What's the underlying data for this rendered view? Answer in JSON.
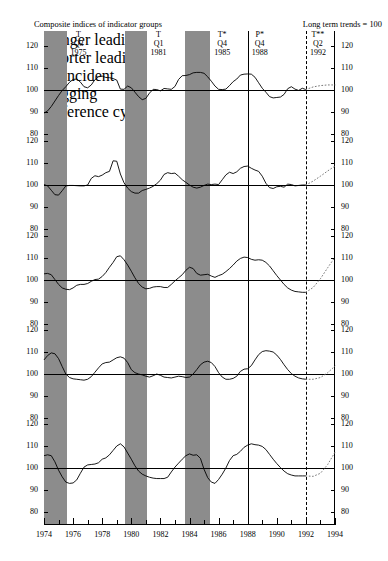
{
  "title": {
    "left": "Composite indices of indicator groups",
    "right": "Long term trends = 100"
  },
  "chart_data": {
    "type": "line",
    "title": "Composite indices of indicator groups",
    "subtitle": "Long term trends = 100",
    "xlabel": "",
    "ylabel": "",
    "xlim": [
      1974,
      1994
    ],
    "ylim": [
      80,
      120
    ],
    "yticks": [
      80,
      90,
      100,
      110,
      120
    ],
    "xticks": [
      1974,
      1975,
      1976,
      1977,
      1978,
      1979,
      1980,
      1981,
      1982,
      1983,
      1984,
      1985,
      1986,
      1987,
      1988,
      1989,
      1990,
      1991,
      1992,
      1993,
      1994
    ],
    "xticklabels": [
      "1974",
      "1976",
      "1978",
      "1980",
      "1982",
      "1984",
      "1986",
      "1988",
      "1990",
      "1992",
      "1994"
    ],
    "grid": false,
    "reference_line": 100,
    "legend_position": "inline-panel-label",
    "panels": [
      {
        "name": "Longer leading",
        "label": "Longer leading",
        "x": [
          1974.0,
          1974.25,
          1974.5,
          1974.75,
          1975.0,
          1975.25,
          1975.5,
          1975.75,
          1976.0,
          1976.25,
          1976.5,
          1976.75,
          1977.0,
          1977.25,
          1977.5,
          1977.75,
          1978.0,
          1978.25,
          1978.5,
          1978.75,
          1979.0,
          1979.25,
          1979.5,
          1979.75,
          1980.0,
          1980.25,
          1980.5,
          1980.75,
          1981.0,
          1981.25,
          1981.5,
          1981.75,
          1982.0,
          1982.25,
          1982.5,
          1982.75,
          1983.0,
          1983.25,
          1983.5,
          1983.75,
          1984.0,
          1984.25,
          1984.5,
          1984.75,
          1985.0,
          1985.25,
          1985.5,
          1985.75,
          1986.0,
          1986.25,
          1986.5,
          1986.75,
          1987.0,
          1987.25,
          1987.5,
          1987.75,
          1988.0,
          1988.25,
          1988.5,
          1988.75,
          1989.0,
          1989.25,
          1989.5,
          1989.75,
          1990.0,
          1990.25,
          1990.5,
          1990.75,
          1991.0,
          1991.25,
          1991.5,
          1991.75,
          1992.0
        ],
        "values": [
          89.5,
          90.5,
          92.5,
          95.0,
          97.5,
          99.8,
          101.5,
          103.5,
          104.8,
          105.0,
          103.6,
          101.5,
          101.0,
          102.3,
          104.7,
          106.0,
          106.3,
          105.7,
          105.6,
          105.2,
          104.5,
          100.4,
          100.3,
          101.8,
          101.0,
          99.0,
          97.0,
          95.6,
          96.2,
          98.6,
          100.3,
          100.2,
          99.6,
          100.7,
          100.5,
          100.3,
          101.6,
          104.8,
          106.5,
          106.6,
          107.0,
          107.8,
          108.0,
          108.0,
          107.6,
          106.0,
          104.0,
          101.8,
          100.3,
          100.2,
          100.4,
          102.0,
          103.8,
          105.0,
          106.8,
          107.2,
          107.3,
          107.2,
          105.8,
          103.3,
          100.8,
          99.0,
          97.0,
          96.4,
          96.6,
          96.8,
          98.0,
          100.6,
          101.5,
          100.4,
          99.8,
          100.8,
          100.2
        ],
        "forecast_x": [
          1992.0,
          1992.5,
          1993.0,
          1993.5,
          1994.0
        ],
        "forecast_values": [
          100.2,
          101.4,
          102.0,
          102.3,
          102.3
        ]
      },
      {
        "name": "Shorter leading",
        "label": "Shorter leading",
        "x": [
          1974.0,
          1974.25,
          1974.5,
          1974.75,
          1975.0,
          1975.25,
          1975.5,
          1975.75,
          1976.0,
          1976.25,
          1976.5,
          1976.75,
          1977.0,
          1977.25,
          1977.5,
          1977.75,
          1978.0,
          1978.25,
          1978.5,
          1978.75,
          1979.0,
          1979.25,
          1979.5,
          1979.75,
          1980.0,
          1980.25,
          1980.5,
          1980.75,
          1981.0,
          1981.25,
          1981.5,
          1981.75,
          1982.0,
          1982.25,
          1982.5,
          1982.75,
          1983.0,
          1983.25,
          1983.5,
          1983.75,
          1984.0,
          1984.25,
          1984.5,
          1984.75,
          1985.0,
          1985.25,
          1985.5,
          1985.75,
          1986.0,
          1986.25,
          1986.5,
          1986.75,
          1987.0,
          1987.25,
          1987.5,
          1987.75,
          1988.0,
          1988.25,
          1988.5,
          1988.75,
          1989.0,
          1989.25,
          1989.5,
          1989.75,
          1990.0,
          1990.25,
          1990.5,
          1990.75,
          1991.0,
          1991.25,
          1991.5,
          1991.75,
          1992.0
        ],
        "values": [
          100.2,
          99.6,
          97.6,
          95.6,
          95.4,
          97.4,
          99.6,
          99.8,
          99.8,
          99.7,
          99.6,
          99.6,
          100.0,
          103.0,
          104.2,
          103.8,
          104.5,
          105.6,
          106.2,
          111.0,
          110.8,
          105.0,
          101.0,
          98.6,
          97.0,
          96.3,
          96.3,
          97.5,
          98.0,
          98.6,
          99.4,
          100.6,
          102.2,
          104.8,
          105.6,
          105.2,
          105.4,
          104.0,
          102.4,
          101.2,
          100.0,
          99.0,
          98.6,
          99.0,
          99.8,
          100.4,
          100.2,
          100.4,
          100.2,
          102.4,
          104.6,
          105.8,
          105.2,
          106.0,
          107.6,
          108.4,
          108.6,
          107.6,
          106.8,
          106.2,
          104.0,
          100.8,
          98.8,
          98.4,
          99.2,
          99.4,
          99.0,
          100.4,
          100.2,
          99.6,
          99.8,
          100.0,
          100.0
        ],
        "forecast_x": [
          1992.0,
          1992.5,
          1993.0,
          1993.5,
          1994.0
        ],
        "forecast_values": [
          100.0,
          101.8,
          104.0,
          106.4,
          108.6
        ]
      },
      {
        "name": "Coincident",
        "label": "Coincident",
        "x": [
          1974.0,
          1974.25,
          1974.5,
          1974.75,
          1975.0,
          1975.25,
          1975.5,
          1975.75,
          1976.0,
          1976.25,
          1976.5,
          1976.75,
          1977.0,
          1977.25,
          1977.5,
          1977.75,
          1978.0,
          1978.25,
          1978.5,
          1978.75,
          1979.0,
          1979.25,
          1979.5,
          1979.75,
          1980.0,
          1980.25,
          1980.5,
          1980.75,
          1981.0,
          1981.25,
          1981.5,
          1981.75,
          1982.0,
          1982.25,
          1982.5,
          1982.75,
          1983.0,
          1983.25,
          1983.5,
          1983.75,
          1984.0,
          1984.25,
          1984.5,
          1984.75,
          1985.0,
          1985.25,
          1985.5,
          1985.75,
          1986.0,
          1986.25,
          1986.5,
          1986.75,
          1987.0,
          1987.25,
          1987.5,
          1987.75,
          1988.0,
          1988.25,
          1988.5,
          1988.75,
          1989.0,
          1989.25,
          1989.5,
          1989.75,
          1990.0,
          1990.25,
          1990.5,
          1990.75,
          1991.0,
          1991.25,
          1991.5,
          1991.75,
          1992.0
        ],
        "values": [
          102.8,
          103.0,
          102.4,
          100.2,
          98.0,
          96.4,
          95.8,
          95.6,
          96.4,
          97.6,
          98.0,
          98.0,
          98.4,
          99.4,
          100.2,
          100.4,
          101.6,
          103.4,
          105.8,
          108.0,
          110.6,
          111.0,
          109.2,
          106.8,
          104.0,
          101.0,
          98.4,
          96.8,
          96.0,
          96.2,
          96.8,
          97.0,
          97.0,
          96.6,
          96.6,
          98.0,
          99.6,
          101.0,
          102.4,
          104.4,
          105.8,
          105.2,
          103.0,
          102.2,
          102.4,
          102.6,
          101.8,
          101.2,
          102.0,
          102.6,
          103.8,
          105.2,
          106.8,
          108.6,
          109.8,
          110.4,
          110.2,
          109.4,
          109.0,
          109.2,
          109.0,
          108.0,
          106.4,
          104.2,
          102.0,
          100.0,
          98.0,
          96.4,
          95.4,
          94.8,
          94.6,
          94.4,
          94.4
        ],
        "forecast_x": [
          1992.0,
          1992.5,
          1993.0,
          1993.5,
          1994.0
        ],
        "forecast_values": [
          94.4,
          96.6,
          100.6,
          105.6,
          110.4
        ]
      },
      {
        "name": "Lagging",
        "label": "Lagging",
        "x": [
          1974.0,
          1974.25,
          1974.5,
          1974.75,
          1975.0,
          1975.25,
          1975.5,
          1975.75,
          1976.0,
          1976.25,
          1976.5,
          1976.75,
          1977.0,
          1977.25,
          1977.5,
          1977.75,
          1978.0,
          1978.25,
          1978.5,
          1978.75,
          1979.0,
          1979.25,
          1979.5,
          1979.75,
          1980.0,
          1980.25,
          1980.5,
          1980.75,
          1981.0,
          1981.25,
          1981.5,
          1981.75,
          1982.0,
          1982.25,
          1982.5,
          1982.75,
          1983.0,
          1983.25,
          1983.5,
          1983.75,
          1984.0,
          1984.25,
          1984.5,
          1984.75,
          1985.0,
          1985.25,
          1985.5,
          1985.75,
          1986.0,
          1986.25,
          1986.5,
          1986.75,
          1987.0,
          1987.25,
          1987.5,
          1987.75,
          1988.0,
          1988.25,
          1988.5,
          1988.75,
          1989.0,
          1989.25,
          1989.5,
          1989.75,
          1990.0,
          1990.25,
          1990.5,
          1990.75,
          1991.0,
          1991.25,
          1991.5,
          1991.75,
          1992.0
        ],
        "values": [
          106.4,
          108.4,
          109.6,
          109.2,
          107.0,
          103.4,
          100.0,
          98.4,
          97.8,
          97.6,
          97.4,
          97.2,
          97.6,
          98.8,
          100.8,
          102.8,
          104.6,
          105.2,
          105.4,
          106.4,
          107.4,
          107.8,
          107.2,
          105.2,
          102.0,
          100.6,
          100.0,
          99.6,
          99.0,
          98.6,
          99.2,
          100.0,
          99.4,
          98.6,
          98.4,
          98.2,
          98.6,
          99.0,
          98.8,
          98.4,
          98.6,
          100.0,
          102.0,
          104.2,
          105.4,
          105.8,
          105.2,
          103.4,
          100.6,
          98.6,
          97.6,
          97.6,
          98.0,
          99.0,
          101.2,
          102.2,
          102.4,
          103.8,
          106.4,
          108.8,
          110.2,
          110.6,
          110.4,
          110.0,
          108.6,
          106.6,
          104.2,
          102.0,
          100.2,
          99.0,
          98.2,
          97.8,
          97.6
        ],
        "forecast_x": [
          1992.0,
          1992.5,
          1993.0,
          1993.5,
          1994.0
        ],
        "forecast_values": [
          97.6,
          97.6,
          98.4,
          100.6,
          103.6
        ]
      },
      {
        "name": "Reference cycle",
        "label": "Reference cycle",
        "x": [
          1974.0,
          1974.25,
          1974.5,
          1974.75,
          1975.0,
          1975.25,
          1975.5,
          1975.75,
          1976.0,
          1976.25,
          1976.5,
          1976.75,
          1977.0,
          1977.25,
          1977.5,
          1977.75,
          1978.0,
          1978.25,
          1978.5,
          1978.75,
          1979.0,
          1979.25,
          1979.5,
          1979.75,
          1980.0,
          1980.25,
          1980.5,
          1980.75,
          1981.0,
          1981.25,
          1981.5,
          1981.75,
          1982.0,
          1982.25,
          1982.5,
          1982.75,
          1983.0,
          1983.25,
          1983.5,
          1983.75,
          1984.0,
          1984.25,
          1984.5,
          1984.75,
          1985.0,
          1985.25,
          1985.5,
          1985.75,
          1986.0,
          1986.25,
          1986.5,
          1986.75,
          1987.0,
          1987.25,
          1987.5,
          1987.75,
          1988.0,
          1988.25,
          1988.5,
          1988.75,
          1989.0,
          1989.25,
          1989.5,
          1989.75,
          1990.0,
          1990.25,
          1990.5,
          1990.75,
          1991.0,
          1991.25,
          1991.5,
          1991.75,
          1992.0
        ],
        "values": [
          105.6,
          106.0,
          105.6,
          102.8,
          99.0,
          96.0,
          93.6,
          93.0,
          93.2,
          94.6,
          97.6,
          100.4,
          101.4,
          101.6,
          101.8,
          102.4,
          104.0,
          104.6,
          106.0,
          108.0,
          110.0,
          111.0,
          109.6,
          106.8,
          104.0,
          101.0,
          98.6,
          97.2,
          96.4,
          95.8,
          95.4,
          95.2,
          95.2,
          95.2,
          95.8,
          98.2,
          100.4,
          102.2,
          104.0,
          105.6,
          106.4,
          105.8,
          106.0,
          104.4,
          99.4,
          95.6,
          93.6,
          93.0,
          94.8,
          97.2,
          100.0,
          103.4,
          105.6,
          106.2,
          107.6,
          109.4,
          110.4,
          111.0,
          110.6,
          110.4,
          109.8,
          108.4,
          106.2,
          104.0,
          102.0,
          100.2,
          98.6,
          97.4,
          96.8,
          96.4,
          96.4,
          96.4,
          96.4
        ],
        "forecast_x": [
          1992.0,
          1992.5,
          1993.0,
          1993.5,
          1994.0
        ],
        "forecast_values": [
          96.4,
          96.2,
          97.6,
          101.6,
          107.2
        ]
      }
    ],
    "recession_bands": [
      {
        "start": 1974.0,
        "end": 1975.55
      },
      {
        "start": 1979.55,
        "end": 1981.05
      },
      {
        "start": 1983.72,
        "end": 1985.42
      }
    ],
    "turning_points": [
      {
        "type": "T",
        "quarter": "Q3",
        "year": "1975",
        "x": 1975.55,
        "line": false
      },
      {
        "type": "P",
        "quarter": "Q3",
        "year": "1979",
        "x": 1979.55,
        "line": false
      },
      {
        "type": "T",
        "quarter": "Q1",
        "year": "1981",
        "x": 1981.05,
        "line": false
      },
      {
        "type": "P*",
        "quarter": "Q1",
        "year": "1984",
        "x": 1983.72,
        "line": false
      },
      {
        "type": "T*",
        "quarter": "Q4",
        "year": "1985",
        "x": 1985.42,
        "line": false
      },
      {
        "type": "P*",
        "quarter": "Q4",
        "year": "1988",
        "x": 1988.0,
        "line": "solid"
      },
      {
        "type": "T**",
        "quarter": "Q2",
        "year": "1992",
        "x": 1992.0,
        "line": "dashed"
      }
    ],
    "axis_endcaps": {
      "left": "120",
      "right": "120",
      "bottom_left": "80",
      "bottom_right": "80"
    }
  }
}
